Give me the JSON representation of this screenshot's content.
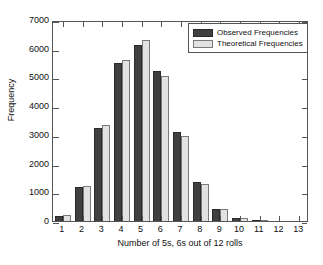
{
  "chart_data": {
    "type": "bar",
    "title": "",
    "xlabel": "Number of 5s, 6s out of 12 rolls",
    "ylabel": "Frequency",
    "categories": [
      "1",
      "2",
      "3",
      "4",
      "5",
      "6",
      "7",
      "8",
      "9",
      "10",
      "11",
      "12",
      "13"
    ],
    "series": [
      {
        "name": "Observed Frequencies",
        "color": "#404040",
        "values": [
          180,
          1180,
          3250,
          5490,
          6120,
          5230,
          3090,
          1350,
          430,
          120,
          20,
          0,
          0
        ]
      },
      {
        "name": "Theoretical Frequencies",
        "color": "#E2E2E2",
        "values": [
          220,
          1230,
          3330,
          5600,
          6290,
          5040,
          2950,
          1290,
          420,
          110,
          15,
          0,
          0
        ]
      }
    ],
    "ylim": [
      0,
      7000
    ],
    "yticks": [
      0,
      1000,
      2000,
      3000,
      4000,
      5000,
      6000,
      7000
    ],
    "ytick_labels": [
      "0",
      "1000",
      "2000",
      "3000",
      "4000",
      "5000",
      "6000",
      "7000"
    ],
    "grid": false,
    "legend_position": "top-right",
    "legend_entries": [
      "Observed Frequencies",
      "Theoretical Frequencies"
    ]
  }
}
